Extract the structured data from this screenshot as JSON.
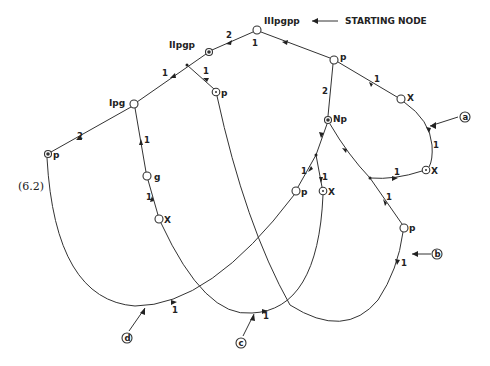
{
  "figure": {
    "equation_label": "(6.2)",
    "starting_node_annotation": "STARTING NODE"
  },
  "nodes": [
    {
      "id": "root",
      "label": "IIIpgpp",
      "x": 257,
      "y": 30,
      "type": "open"
    },
    {
      "id": "n2",
      "label": "IIpgp",
      "x": 209,
      "y": 52,
      "type": "filled"
    },
    {
      "id": "n3",
      "label": "Ipg",
      "x": 134,
      "y": 104,
      "type": "open"
    },
    {
      "id": "n4",
      "label": "p",
      "x": 48,
      "y": 154,
      "type": "filled"
    },
    {
      "id": "n5",
      "label": "g",
      "x": 147,
      "y": 176,
      "type": "open"
    },
    {
      "id": "n6",
      "label": "X",
      "x": 159,
      "y": 219,
      "type": "open"
    },
    {
      "id": "n7",
      "label": "p",
      "x": 216,
      "y": 92,
      "type": "dot"
    },
    {
      "id": "n8",
      "label": "p",
      "x": 334,
      "y": 60,
      "type": "open"
    },
    {
      "id": "n9",
      "label": "X",
      "x": 401,
      "y": 99,
      "type": "open"
    },
    {
      "id": "n10",
      "label": "Np",
      "x": 328,
      "y": 120,
      "type": "filled"
    },
    {
      "id": "n11",
      "label": "p",
      "x": 296,
      "y": 191,
      "type": "open"
    },
    {
      "id": "n12",
      "label": "X",
      "x": 323,
      "y": 191,
      "type": "dot"
    },
    {
      "id": "n13",
      "label": "X",
      "x": 426,
      "y": 170,
      "type": "dot"
    },
    {
      "id": "n14",
      "label": "p",
      "x": 404,
      "y": 228,
      "type": "open"
    }
  ],
  "edge_weights": [
    {
      "label": "1",
      "x": 252,
      "y": 46
    },
    {
      "label": "2",
      "x": 226,
      "y": 35
    },
    {
      "label": "1",
      "x": 165,
      "y": 74
    },
    {
      "label": "1",
      "x": 206,
      "y": 74
    },
    {
      "label": "2",
      "x": 75,
      "y": 136
    },
    {
      "label": "1",
      "x": 143,
      "y": 143
    },
    {
      "label": "1",
      "x": 147,
      "y": 198
    },
    {
      "label": "1",
      "x": 373,
      "y": 80
    },
    {
      "label": "2",
      "x": 323,
      "y": 93
    },
    {
      "label": "1",
      "x": 433,
      "y": 146
    },
    {
      "label": "1",
      "x": 398,
      "y": 176
    },
    {
      "label": "1",
      "x": 303,
      "y": 168
    },
    {
      "label": "1",
      "x": 321,
      "y": 180
    },
    {
      "label": "1",
      "x": 385,
      "y": 200
    },
    {
      "label": "1",
      "x": 401,
      "y": 263
    },
    {
      "label": "1",
      "x": 172,
      "y": 310
    },
    {
      "label": "1",
      "x": 264,
      "y": 317
    }
  ],
  "entry_points": [
    {
      "label": "a",
      "x": 465,
      "y": 117
    },
    {
      "label": "b",
      "x": 437,
      "y": 254
    },
    {
      "label": "c",
      "x": 241,
      "y": 343
    },
    {
      "label": "d",
      "x": 127,
      "y": 338
    }
  ]
}
